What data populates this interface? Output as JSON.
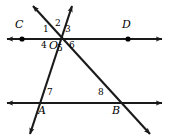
{
  "figure": {
    "width": 169,
    "height": 140,
    "background_color": "#ffffff",
    "stroke_color": "#1a1a1a",
    "point_color": "#000000"
  },
  "points": [
    {
      "name": "C",
      "label": "C",
      "x": 22,
      "y": 39,
      "label_x": 16,
      "label_y": 22,
      "on_line": "upper-parallel-line",
      "dot": true
    },
    {
      "name": "D",
      "label": "D",
      "x": 128,
      "y": 39,
      "label_x": 123,
      "label_y": 22,
      "on_line": "upper-parallel-line",
      "dot": true
    },
    {
      "name": "O",
      "label": "O",
      "x": 59,
      "y": 39,
      "label_x": 50,
      "label_y": 42,
      "on_line": "upper-parallel-line",
      "dot": false
    },
    {
      "name": "A",
      "label": "A",
      "x": 41,
      "y": 103,
      "label_x": 39,
      "label_y": 107,
      "on_line": "lower-parallel-line",
      "dot": false
    },
    {
      "name": "B",
      "label": "B",
      "x": 118,
      "y": 103,
      "label_x": 113,
      "label_y": 107,
      "on_line": "lower-parallel-line",
      "dot": false
    }
  ],
  "lines": [
    {
      "name": "upper-parallel-line",
      "description": "horizontal line through C, O and D",
      "x1": 6,
      "y1": 39,
      "x2": 163,
      "y2": 39,
      "arrow_start": true,
      "arrow_end": true
    },
    {
      "name": "lower-parallel-line",
      "description": "horizontal line through A and B",
      "x1": 6,
      "y1": 103,
      "x2": 163,
      "y2": 103,
      "arrow_start": true,
      "arrow_end": true
    },
    {
      "name": "transversal-through-A",
      "description": "line rising to the upper right through A and O",
      "x1": 30,
      "y1": 134,
      "x2": 72,
      "y2": 6,
      "arrow_start": true,
      "arrow_end": true
    },
    {
      "name": "transversal-through-B",
      "description": "line falling to the lower right through O and B",
      "x1": 33,
      "y1": 6,
      "x2": 150,
      "y2": 134,
      "arrow_start": true,
      "arrow_end": true
    }
  ],
  "angle_labels": [
    {
      "name": "angle-1",
      "label": "1",
      "x": 44,
      "y": 29,
      "vertex": "O",
      "position": "upper-left"
    },
    {
      "name": "angle-2",
      "label": "2",
      "x": 56,
      "y": 24,
      "vertex": "O",
      "position": "top"
    },
    {
      "name": "angle-3",
      "label": "3",
      "x": 66,
      "y": 29,
      "vertex": "O",
      "position": "upper-right"
    },
    {
      "name": "angle-4",
      "label": "4",
      "x": 42,
      "y": 43,
      "vertex": "O",
      "position": "lower-left"
    },
    {
      "name": "angle-5",
      "label": "5",
      "x": 58,
      "y": 46,
      "vertex": "O",
      "position": "bottom"
    },
    {
      "name": "angle-6",
      "label": "6",
      "x": 70,
      "y": 43,
      "vertex": "O",
      "position": "lower-right"
    },
    {
      "name": "angle-7",
      "label": "7",
      "x": 48,
      "y": 91,
      "vertex": "A",
      "position": "upper-right"
    },
    {
      "name": "angle-8",
      "label": "8",
      "x": 99,
      "y": 91,
      "vertex": "B",
      "position": "upper-left"
    }
  ]
}
